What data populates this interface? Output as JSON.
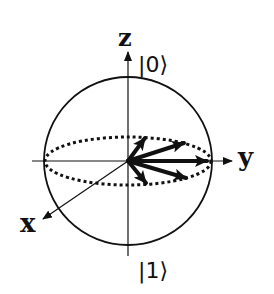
{
  "diagram": {
    "type": "bloch-sphere",
    "colors": {
      "stroke": "#111111",
      "background": "#ffffff"
    },
    "axes": {
      "z": {
        "label": "z"
      },
      "y": {
        "label": "y"
      },
      "x": {
        "label": "x"
      }
    },
    "states": {
      "top": "|0⟩",
      "bottom": "|1⟩"
    },
    "equator": {
      "style": "dotted"
    },
    "state_vectors": [
      {
        "name": "vector-1",
        "tip": [
          145,
          138
        ]
      },
      {
        "name": "vector-2",
        "tip": [
          184,
          143
        ]
      },
      {
        "name": "vector-3",
        "tip": [
          207,
          161
        ]
      },
      {
        "name": "vector-4",
        "tip": [
          186,
          178
        ]
      },
      {
        "name": "vector-5",
        "tip": [
          146,
          183
        ]
      }
    ]
  }
}
